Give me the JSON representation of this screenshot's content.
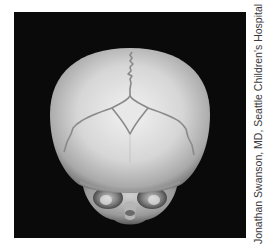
{
  "figure": {
    "background_color": "#0a0a0a",
    "bone_color": "#d9d9d9",
    "suture_color": "#8a8a8a"
  },
  "credit": {
    "text": "Jonathan Swanson, MD, Seattle Children's Hospital"
  }
}
